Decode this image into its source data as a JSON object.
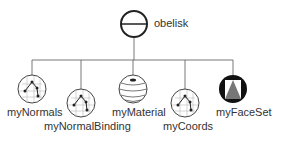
{
  "diagram": {
    "type": "scene-graph",
    "root": {
      "label": "obelisk",
      "icon": "separator-icon"
    },
    "children": [
      {
        "label": "myNormals",
        "icon": "normals-icon"
      },
      {
        "label": "myNormalBinding",
        "icon": "normal-binding-icon"
      },
      {
        "label": "myMaterial",
        "icon": "material-icon"
      },
      {
        "label": "myCoords",
        "icon": "coordinates-icon"
      },
      {
        "label": "myFaceSet",
        "icon": "face-set-icon"
      }
    ]
  }
}
